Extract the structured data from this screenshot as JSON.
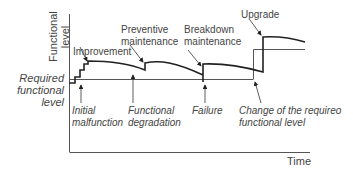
{
  "axes": {
    "y_label_line1": "Functional",
    "y_label_line2": "level",
    "x_label": "Time"
  },
  "required_level_label": [
    "Required",
    "functional",
    "level"
  ],
  "annotations_top": {
    "improvement": "Improvement",
    "preventive_1": "Preventive",
    "preventive_2": "maintenance",
    "breakdown_1": "Breakdown",
    "breakdown_2": "maintenance",
    "upgrade": "Upgrade"
  },
  "annotations_bottom": {
    "initial_1": "Initial",
    "initial_2": "malfunction",
    "degradation_1": "Functional",
    "degradation_2": "degradation",
    "failure": "Failure",
    "change_1": "Change of the requireo",
    "change_2": "functional level"
  }
}
